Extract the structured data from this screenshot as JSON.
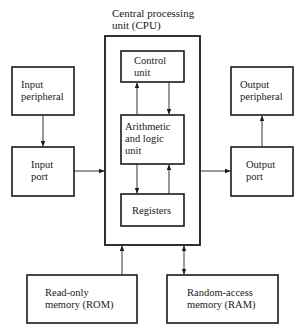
{
  "title": {
    "line1": "Central processing",
    "line2": "unit (CPU)"
  },
  "nodes": {
    "input_peripheral": {
      "line1": "Input",
      "line2": "peripheral"
    },
    "input_port": {
      "line1": "Input",
      "line2": "port"
    },
    "control_unit": {
      "line1": "Control",
      "line2": "unit"
    },
    "alu": {
      "line1": "Arithmetic",
      "line2": "and logic",
      "line3": "unit"
    },
    "registers": {
      "line1": "Registers"
    },
    "output_peripheral": {
      "line1": "Output",
      "line2": "peripheral"
    },
    "output_port": {
      "line1": "Output",
      "line2": "port"
    },
    "rom": {
      "line1": "Read-only",
      "line2": "memory (ROM)"
    },
    "ram": {
      "line1": "Random-access",
      "line2": "memory (RAM)"
    }
  },
  "edges": [
    {
      "from": "Input peripheral",
      "to": "Input port",
      "direction": "one-way"
    },
    {
      "from": "Input port",
      "to": "Central processing unit (CPU)",
      "direction": "one-way"
    },
    {
      "from": "Arithmetic and logic unit",
      "to": "Control unit",
      "direction": "one-way"
    },
    {
      "from": "Control unit",
      "to": "Arithmetic and logic unit",
      "direction": "one-way"
    },
    {
      "from": "Arithmetic and logic unit",
      "to": "Registers",
      "direction": "one-way"
    },
    {
      "from": "Registers",
      "to": "Arithmetic and logic unit",
      "direction": "one-way"
    },
    {
      "from": "Central processing unit (CPU)",
      "to": "Output port",
      "direction": "one-way"
    },
    {
      "from": "Output port",
      "to": "Output peripheral",
      "direction": "one-way"
    },
    {
      "from": "Read-only memory (ROM)",
      "to": "Central processing unit (CPU)",
      "direction": "one-way"
    },
    {
      "from": "Central processing unit (CPU)",
      "to": "Random-access memory (RAM)",
      "direction": "two-way"
    }
  ]
}
